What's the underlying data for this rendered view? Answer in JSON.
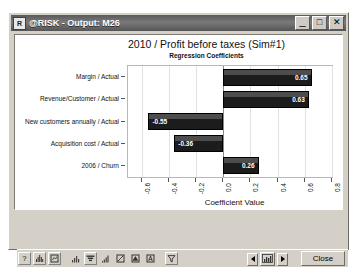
{
  "window": {
    "title": "@RISK - Output: M26",
    "app_icon": "risk-app-icon",
    "minimize_label": "_",
    "maximize_label": "□",
    "close_label": "✕"
  },
  "chart_data": {
    "type": "bar",
    "orientation": "horizontal",
    "title": "2010 / Profit before taxes (Sim#1)",
    "subtitle": "Regression Coefficients",
    "xlabel": "Coefficient Value",
    "ylabel": "",
    "categories": [
      "Margin / Actual",
      "Revenue/Customer / Actual",
      "New customers annually / Actual",
      "Acquisition cost / Actual",
      "2006 / Churn"
    ],
    "values": [
      0.65,
      0.63,
      -0.55,
      -0.36,
      0.26
    ],
    "value_labels": [
      "0.65",
      "0.63",
      "-0.55",
      "-0.36",
      "0.26"
    ],
    "xlim": [
      -0.7,
      0.8
    ],
    "xticks": [
      -0.6,
      -0.4,
      -0.2,
      0.0,
      0.2,
      0.4,
      0.6,
      0.8
    ],
    "xtick_labels": [
      "-0.6",
      "-0.4",
      "-0.2",
      "0.0",
      "0.2",
      "0.4",
      "0.6",
      "0.8"
    ],
    "grid": true,
    "legend": false,
    "bar_color": "#1c1c1c",
    "zero_line": 0.0
  },
  "toolbar": {
    "left_icons": [
      {
        "name": "help-icon",
        "glyph": "?"
      },
      {
        "name": "histogram-icon",
        "glyph": "histogram"
      },
      {
        "name": "report-icon",
        "glyph": "report"
      }
    ],
    "chart_icons": [
      {
        "name": "bar-chart-icon",
        "glyph": "bars"
      },
      {
        "name": "tornado-chart-icon",
        "glyph": "tornado"
      },
      {
        "name": "cumulative-chart-icon",
        "glyph": "cumulative"
      },
      {
        "name": "scatter-chart-icon",
        "glyph": "scatter"
      },
      {
        "name": "summary-chart-icon",
        "glyph": "summary"
      },
      {
        "name": "statistics-icon",
        "glyph": "A"
      },
      {
        "name": "filter-icon",
        "glyph": "funnel"
      }
    ],
    "nav": {
      "prev_label": "◄",
      "next_label": "►",
      "center_icon": "thumbnail-icon"
    },
    "close_label": "Close"
  }
}
